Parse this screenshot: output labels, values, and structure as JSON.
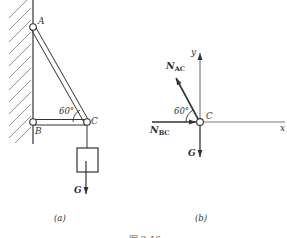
{
  "figure": {
    "caption": "图 2-16",
    "colors": {
      "ink": "#333333",
      "background": "#ffffff",
      "hatch": "#666666"
    }
  },
  "panel_a": {
    "label": "(a)",
    "points": {
      "A": "A",
      "B": "B",
      "C": "C"
    },
    "angle": "60°",
    "load": "G"
  },
  "panel_b": {
    "label": "(b)",
    "axes": {
      "x": "x",
      "y": "y"
    },
    "point": "C",
    "angle": "60°",
    "forces": {
      "nac_main": "N",
      "nac_sub": "AC",
      "nbc_main": "N",
      "nbc_sub": "BC",
      "g": "G"
    }
  }
}
